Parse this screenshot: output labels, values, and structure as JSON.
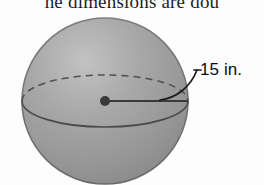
{
  "figure": {
    "kind": "sphere-diagram",
    "caption_clipped_text": "he dimensions are dou",
    "dimension_label": "15 in.",
    "colors": {
      "sphere_fill_light": "#b9b9b9",
      "sphere_fill_mid": "#9c9c9c",
      "sphere_fill_dark": "#8a8a8a",
      "outline": "#6b6b6b",
      "equator_line": "#4a4a4a",
      "radius_line": "#3a3a3a",
      "center_dot": "#3a3a3a",
      "label_text": "#0d0d0d",
      "caption_text": "#1d1d1d",
      "background": "#fdfdfd"
    },
    "geometry": {
      "sphere_center_x": 105,
      "sphere_center_y": 101,
      "sphere_radius_x": 83,
      "sphere_radius_y": 83,
      "equator_ry": 26,
      "radius_line_start_x": 105,
      "radius_line_end_x": 188,
      "radius_line_y": 101,
      "center_dot_r": 5,
      "leader_arc_start_x": 162,
      "leader_arc_start_y": 99,
      "leader_arc_end_x": 196,
      "leader_arc_end_y": 70
    },
    "parts": {
      "sphere_name": "sphere-body",
      "equator_back_name": "equator-back-dashed",
      "equator_front_name": "equator-front-solid",
      "radius_name": "radius-segment",
      "center_name": "center-point",
      "leader_name": "leader-arc"
    }
  }
}
